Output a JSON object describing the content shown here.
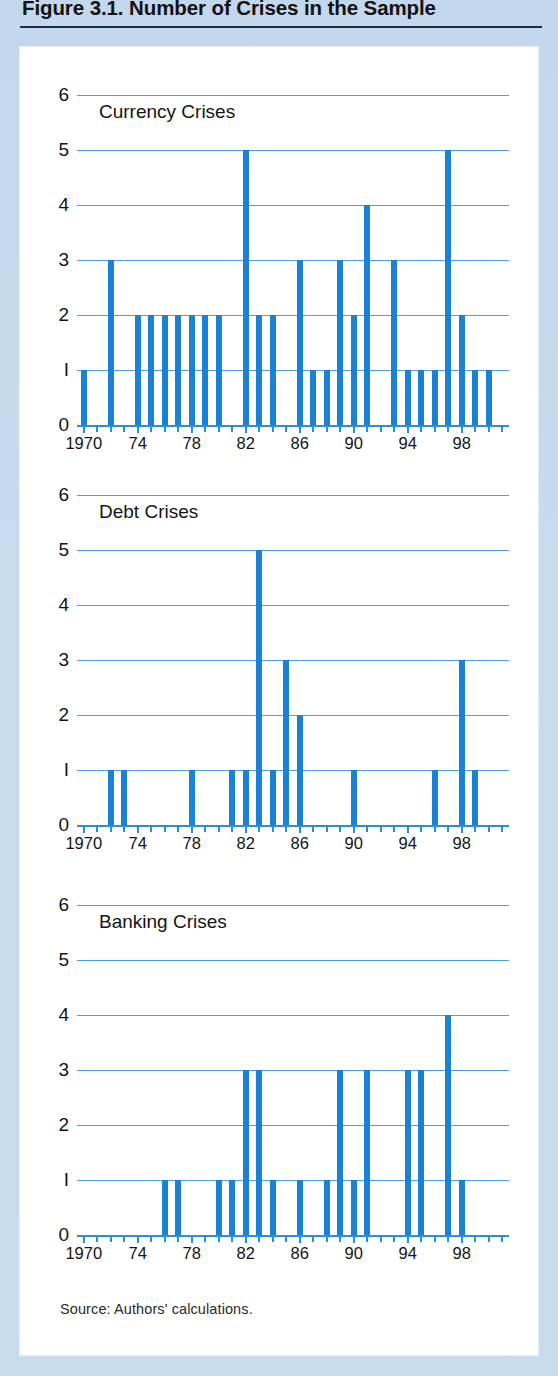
{
  "figure": {
    "title": "Figure 3.1. Number of Crises in the Sample",
    "source": "Source:  Authors' calculations."
  },
  "colors": {
    "bar": "#1b81d4",
    "gridline": "#4f9fdc",
    "axis": "#2b8ed6",
    "panel_background": "#ffffff",
    "page_background": "#c5d9ee",
    "title_rule": "#1b2f4b",
    "text": "#141414"
  },
  "axis": {
    "y_ticks": [
      "0",
      "1",
      "2",
      "3",
      "4",
      "5",
      "6"
    ],
    "y_min": 0,
    "y_max": 6,
    "x_min": 1970,
    "x_max": 2001,
    "x_labels": [
      {
        "value": 1970,
        "label": "1970"
      },
      {
        "value": 1974,
        "label": "74"
      },
      {
        "value": 1978,
        "label": "78"
      },
      {
        "value": 1982,
        "label": "82"
      },
      {
        "value": 1986,
        "label": "86"
      },
      {
        "value": 1990,
        "label": "90"
      },
      {
        "value": 1994,
        "label": "94"
      },
      {
        "value": 1998,
        "label": "98"
      }
    ]
  },
  "chart_data": [
    {
      "type": "bar",
      "title": "Currency Crises",
      "xlabel": "",
      "ylabel": "",
      "ylim": [
        0,
        6
      ],
      "xlim": [
        1970,
        2001
      ],
      "grid": true,
      "legend": "none",
      "categories": [
        1970,
        1971,
        1972,
        1973,
        1974,
        1975,
        1976,
        1977,
        1978,
        1979,
        1980,
        1981,
        1982,
        1983,
        1984,
        1985,
        1986,
        1987,
        1988,
        1989,
        1990,
        1991,
        1992,
        1993,
        1994,
        1995,
        1996,
        1997,
        1998,
        1999,
        2000
      ],
      "values": [
        1,
        0,
        3,
        0,
        2,
        2,
        2,
        2,
        2,
        2,
        2,
        0,
        5,
        2,
        2,
        0,
        3,
        1,
        1,
        3,
        2,
        4,
        0,
        3,
        1,
        1,
        1,
        5,
        2,
        1,
        1
      ]
    },
    {
      "type": "bar",
      "title": "Debt Crises",
      "xlabel": "",
      "ylabel": "",
      "ylim": [
        0,
        6
      ],
      "xlim": [
        1970,
        2001
      ],
      "grid": true,
      "legend": "none",
      "categories": [
        1970,
        1971,
        1972,
        1973,
        1974,
        1975,
        1976,
        1977,
        1978,
        1979,
        1980,
        1981,
        1982,
        1983,
        1984,
        1985,
        1986,
        1987,
        1988,
        1989,
        1990,
        1991,
        1992,
        1993,
        1994,
        1995,
        1996,
        1997,
        1998,
        1999,
        2000
      ],
      "values": [
        0,
        0,
        1,
        1,
        0,
        0,
        0,
        0,
        1,
        0,
        0,
        1,
        1,
        5,
        1,
        3,
        2,
        0,
        0,
        0,
        1,
        0,
        0,
        0,
        0,
        0,
        1,
        0,
        3,
        1,
        0
      ]
    },
    {
      "type": "bar",
      "title": "Banking Crises",
      "xlabel": "",
      "ylabel": "",
      "ylim": [
        0,
        6
      ],
      "xlim": [
        1970,
        2001
      ],
      "grid": true,
      "legend": "none",
      "categories": [
        1970,
        1971,
        1972,
        1973,
        1974,
        1975,
        1976,
        1977,
        1978,
        1979,
        1980,
        1981,
        1982,
        1983,
        1984,
        1985,
        1986,
        1987,
        1988,
        1989,
        1990,
        1991,
        1992,
        1993,
        1994,
        1995,
        1996,
        1997,
        1998,
        1999,
        2000
      ],
      "values": [
        0,
        0,
        0,
        0,
        0,
        0,
        1,
        1,
        0,
        0,
        1,
        1,
        3,
        3,
        1,
        0,
        1,
        0,
        1,
        3,
        1,
        3,
        0,
        0,
        3,
        3,
        0,
        4,
        1,
        0,
        0
      ]
    }
  ]
}
